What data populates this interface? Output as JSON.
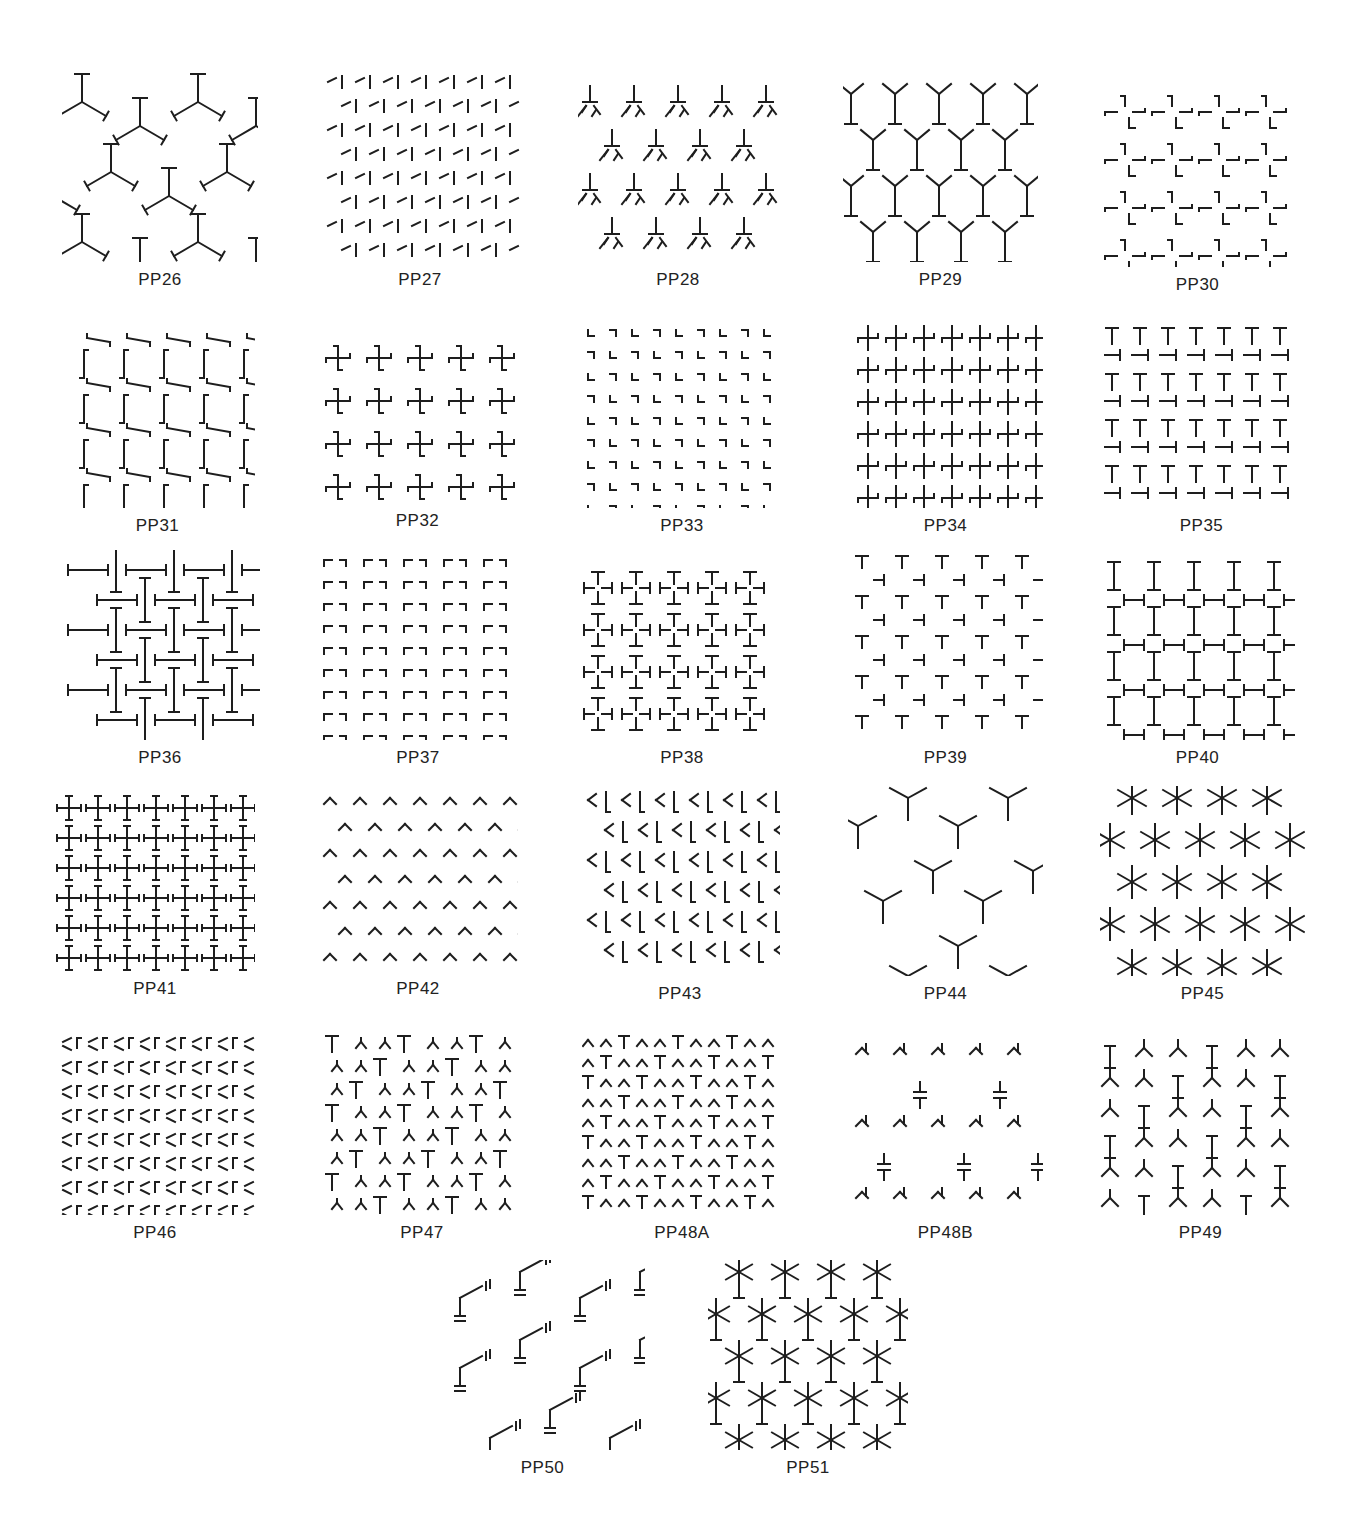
{
  "figure": {
    "panels": [
      {
        "label": "PP26",
        "motif": "tripod-y-bars",
        "x": 62,
        "y": 72,
        "w": 196,
        "h": 190
      },
      {
        "label": "PP27",
        "motif": "hexagonal-corner-hooks",
        "x": 320,
        "y": 72,
        "w": 200,
        "h": 190
      },
      {
        "label": "PP28",
        "motif": "inverted-t-with-lambdas",
        "x": 578,
        "y": 72,
        "w": 200,
        "h": 190
      },
      {
        "label": "PP29",
        "motif": "hexagon-y-network",
        "x": 843,
        "y": 72,
        "w": 195,
        "h": 190
      },
      {
        "label": "PP30",
        "motif": "l-corner-crosses",
        "x": 1100,
        "y": 72,
        "w": 195,
        "h": 195
      },
      {
        "label": "PP31",
        "motif": "staggered-z-hooks",
        "x": 60,
        "y": 318,
        "w": 195,
        "h": 190
      },
      {
        "label": "PP32",
        "motif": "pinwheel-crosses",
        "x": 320,
        "y": 318,
        "w": 195,
        "h": 185
      },
      {
        "label": "PP33",
        "motif": "dense-corner-brackets",
        "x": 582,
        "y": 318,
        "w": 200,
        "h": 190
      },
      {
        "label": "PP34",
        "motif": "pinwheel-grid",
        "x": 848,
        "y": 318,
        "w": 195,
        "h": 190
      },
      {
        "label": "PP35",
        "motif": "alternating-t-bars",
        "x": 1104,
        "y": 318,
        "w": 195,
        "h": 190
      },
      {
        "label": "PP36",
        "motif": "woven-i-beams",
        "x": 60,
        "y": 550,
        "w": 200,
        "h": 190
      },
      {
        "label": "PP37",
        "motif": "bracket-lattice",
        "x": 318,
        "y": 550,
        "w": 200,
        "h": 190
      },
      {
        "label": "PP38",
        "motif": "t-cross-clusters",
        "x": 582,
        "y": 550,
        "w": 200,
        "h": 190
      },
      {
        "label": "PP39",
        "motif": "diagonal-t-lattice",
        "x": 848,
        "y": 550,
        "w": 195,
        "h": 190
      },
      {
        "label": "PP40",
        "motif": "i-beam-square-grid",
        "x": 1100,
        "y": 550,
        "w": 195,
        "h": 190
      },
      {
        "label": "PP41",
        "motif": "capped-plus-grid",
        "x": 55,
        "y": 786,
        "w": 200,
        "h": 185
      },
      {
        "label": "PP42",
        "motif": "chevron-hooks",
        "x": 318,
        "y": 786,
        "w": 200,
        "h": 185
      },
      {
        "label": "PP43",
        "motif": "rotated-hooks",
        "x": 580,
        "y": 786,
        "w": 200,
        "h": 190
      },
      {
        "label": "PP44",
        "motif": "large-hexagon-y",
        "x": 848,
        "y": 786,
        "w": 195,
        "h": 190
      },
      {
        "label": "PP45",
        "motif": "asterisk-stars",
        "x": 1100,
        "y": 786,
        "w": 205,
        "h": 190
      },
      {
        "label": "PP46",
        "motif": "dense-x-brackets",
        "x": 55,
        "y": 1030,
        "w": 200,
        "h": 185
      },
      {
        "label": "PP47",
        "motif": "t-and-y-rows",
        "x": 322,
        "y": 1030,
        "w": 200,
        "h": 185
      },
      {
        "label": "PP48A",
        "motif": "dense-lambda-rows",
        "x": 582,
        "y": 1030,
        "w": 200,
        "h": 185
      },
      {
        "label": "PP48B",
        "motif": "sparse-hexagon-caps",
        "x": 848,
        "y": 1030,
        "w": 195,
        "h": 185
      },
      {
        "label": "PP49",
        "motif": "i-beam-hex-network",
        "x": 1098,
        "y": 1030,
        "w": 205,
        "h": 185
      },
      {
        "label": "PP50",
        "motif": "hexagon-capacitor-network",
        "x": 440,
        "y": 1260,
        "w": 205,
        "h": 190
      },
      {
        "label": "PP51",
        "motif": "asterisk-i-beam-lattice",
        "x": 708,
        "y": 1260,
        "w": 200,
        "h": 190
      }
    ]
  }
}
